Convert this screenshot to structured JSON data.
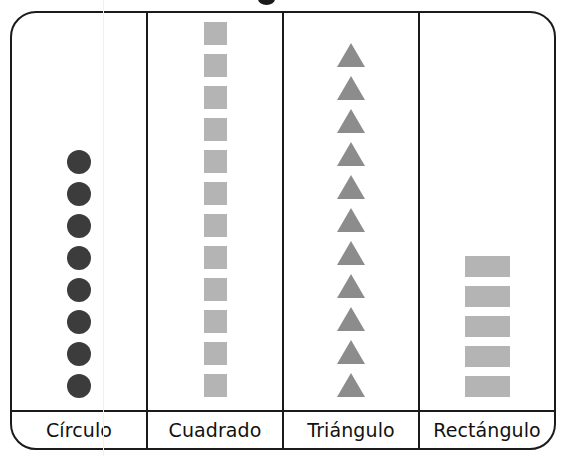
{
  "chart_data": {
    "type": "bar",
    "subtype": "pictograph",
    "title": "",
    "xlabel": "",
    "ylabel": "",
    "orientation": "vertical",
    "grid": false,
    "legend": null,
    "categories": [
      "Círculo",
      "Cuadrado",
      "Triángulo",
      "Rectángulo"
    ],
    "values": [
      8,
      12,
      11,
      5
    ],
    "unit": "1 icon = 1 unit",
    "series": [
      {
        "name": "Conteo de figuras",
        "values": [
          8,
          12,
          11,
          5
        ]
      }
    ],
    "ylim": [
      0,
      12
    ],
    "icon_colors": [
      "#3c3c3c",
      "#b4b4b4",
      "#8c8c8c",
      "#b4b4b4"
    ],
    "icon_shapes": [
      "circle",
      "square",
      "triangle",
      "rectangle"
    ]
  },
  "columns": [
    {
      "id": "circulo",
      "label": "Círculo",
      "count": 8,
      "icon": "circle-icon",
      "color": "#3c3c3c"
    },
    {
      "id": "cuadrado",
      "label": "Cuadrado",
      "count": 12,
      "icon": "square-icon",
      "color": "#b4b4b4"
    },
    {
      "id": "triangulo",
      "label": "Triángulo",
      "count": 11,
      "icon": "triangle-icon",
      "color": "#8c8c8c"
    },
    {
      "id": "rectangulo",
      "label": "Rectángulo",
      "count": 5,
      "icon": "rectangle-icon",
      "color": "#b4b4b4"
    }
  ],
  "style": {
    "border_color": "#1b1b1b",
    "background": "#ffffff"
  }
}
